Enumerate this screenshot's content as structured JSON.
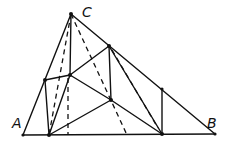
{
  "diagram": {
    "type": "geometry-triangle-construction",
    "labels": {
      "A": "A",
      "B": "B",
      "C": "C"
    },
    "vertices": {
      "A": [
        23,
        135
      ],
      "B": [
        215,
        134
      ],
      "C": [
        71,
        14
      ]
    },
    "points": {
      "P1": [
        45,
        80
      ],
      "P2": [
        70,
        75
      ],
      "P3": [
        109,
        46
      ],
      "P4": [
        111,
        100
      ],
      "P5": [
        162,
        89
      ],
      "D1": [
        49,
        135
      ],
      "D2": [
        162,
        134
      ]
    },
    "stroke_color": "#111111",
    "background": "#ffffff"
  }
}
